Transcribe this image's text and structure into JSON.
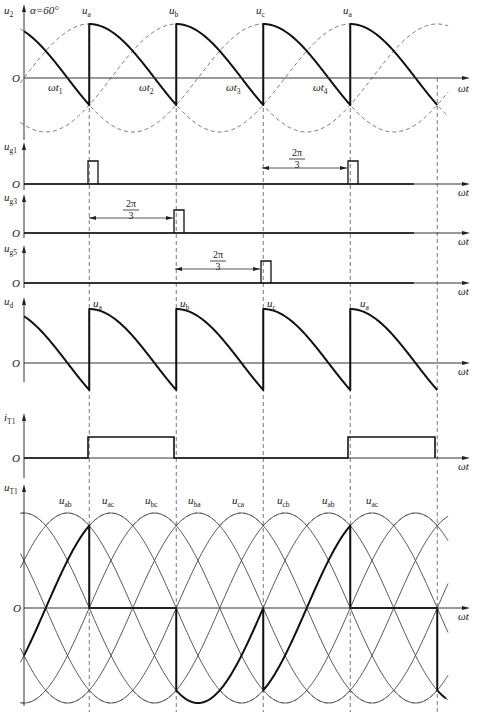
{
  "alpha_label": "α=60°",
  "x_axis_label": "ωt",
  "origin_label": "O",
  "chart_data": {
    "type": "line",
    "alpha_deg": 60,
    "period_deg": 120,
    "firing_angles_deg": [
      90,
      210,
      330,
      450
    ],
    "x_range_deg": [
      -5,
      590
    ],
    "panels": [
      {
        "id": "u2",
        "ylabel": "u2",
        "annotation": "α=60°",
        "series": [
          {
            "name": "ua",
            "formula": "sin(θ)",
            "style": "dashed"
          },
          {
            "name": "ub",
            "formula": "sin(θ-120°)",
            "style": "dashed"
          },
          {
            "name": "uc",
            "formula": "sin(θ-240°)",
            "style": "dashed"
          },
          {
            "name": "ud",
            "formula": "conducting phase voltage from firing until next firing",
            "style": "bold"
          }
        ],
        "curve_labels": [
          "ua",
          "ub",
          "uc",
          "ua"
        ],
        "time_labels": [
          "ωt1",
          "ωt2",
          "ωt3",
          "ωt4"
        ]
      },
      {
        "id": "ug1",
        "ylabel": "ug1",
        "pulses_deg": [
          90,
          450
        ],
        "annotation": "2π/3",
        "annotation_span_deg": [
          330,
          450
        ]
      },
      {
        "id": "ug3",
        "ylabel": "ug3",
        "pulses_deg": [
          210
        ],
        "annotation": "2π/3",
        "annotation_span_deg": [
          90,
          210
        ]
      },
      {
        "id": "ug5",
        "ylabel": "ug5",
        "pulses_deg": [
          330
        ],
        "annotation": "2π/3",
        "annotation_span_deg": [
          210,
          330
        ]
      },
      {
        "id": "ud",
        "ylabel": "ud",
        "curve_labels": [
          "ua",
          "ub",
          "uc",
          "ua"
        ],
        "description": "output voltage, segments of phase voltage from peak down to negative value (-0.5 peak), repeating every 120°"
      },
      {
        "id": "iT1",
        "ylabel": "iT1",
        "conduction_deg": [
          [
            90,
            210
          ],
          [
            450,
            570
          ]
        ],
        "level": 1
      },
      {
        "id": "uT1",
        "ylabel": "uT1",
        "series_labels": [
          "uab",
          "uac",
          "ubc",
          "uba",
          "uca",
          "ucb",
          "uab",
          "uac"
        ],
        "description": "thyristor T1 voltage: zero while conducting, -uab / uac segments while blocked; line voltages sqrt(3) x phase amplitude"
      }
    ]
  },
  "labels": {
    "u2": {
      "main": "u",
      "sub": "2"
    },
    "ug1": {
      "main": "u",
      "sub": "g1"
    },
    "ug3": {
      "main": "u",
      "sub": "g3"
    },
    "ug5": {
      "main": "u",
      "sub": "g5"
    },
    "ud": {
      "main": "u",
      "sub": "d"
    },
    "iT1": {
      "main": "i",
      "sub": "T1"
    },
    "uT1": {
      "main": "u",
      "sub": "T1"
    },
    "top_curves": [
      {
        "main": "u",
        "sub": "a"
      },
      {
        "main": "u",
        "sub": "b"
      },
      {
        "main": "u",
        "sub": "c"
      },
      {
        "main": "u",
        "sub": "a"
      }
    ],
    "time_marks": [
      {
        "main": "ωt",
        "sub": "1"
      },
      {
        "main": "ωt",
        "sub": "2"
      },
      {
        "main": "ωt",
        "sub": "3"
      },
      {
        "main": "ωt",
        "sub": "4"
      }
    ],
    "ud_curves": [
      {
        "main": "u",
        "sub": "a"
      },
      {
        "main": "u",
        "sub": "b"
      },
      {
        "main": "u",
        "sub": "c"
      },
      {
        "main": "u",
        "sub": "a"
      }
    ],
    "uT1_curves": [
      {
        "main": "u",
        "sub": "ab"
      },
      {
        "main": "u",
        "sub": "ac"
      },
      {
        "main": "u",
        "sub": "bc"
      },
      {
        "main": "u",
        "sub": "ba"
      },
      {
        "main": "u",
        "sub": "ca"
      },
      {
        "main": "u",
        "sub": "cb"
      },
      {
        "main": "u",
        "sub": "ab"
      },
      {
        "main": "u",
        "sub": "ac"
      }
    ],
    "fraction_num": "2π",
    "fraction_den": "3"
  }
}
